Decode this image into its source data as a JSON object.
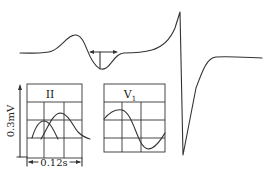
{
  "diagram": {
    "type": "ecg-p-wave-illustration",
    "main_trace": {
      "description": "Enlarged P wave with biphasic terminal negative portion followed by QRS complex",
      "measurement_arrow": "horizontal double-headed arrow over negative deflection with vertical depth marker"
    },
    "lead_ii_panel": {
      "label": "II",
      "description": "Bifid (notched) P wave, two overlapping humps"
    },
    "lead_v1_panel": {
      "label": "V",
      "label_subscript": "1",
      "description": "Biphasic P wave with prominent terminal negative component"
    },
    "scale": {
      "vertical": "0.3mV",
      "horizontal": "0.12s"
    }
  }
}
